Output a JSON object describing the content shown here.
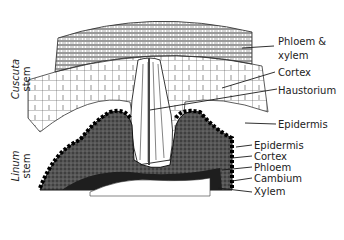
{
  "figure": {
    "side_labels": {
      "cuscuta": {
        "name": "Cuscuta",
        "suffix": "stem"
      },
      "linum": {
        "name": "Linum",
        "suffix": "stem"
      }
    },
    "labels": {
      "phloem_xylem_1": "Phloem &",
      "phloem_xylem_2": "xylem",
      "cortex_top": "Cortex",
      "haustorium": "Haustorium",
      "epidermis_top": "Epidermis",
      "epidermis_bottom": "Epidermis",
      "cortex_bottom": "Cortex",
      "phloem": "Phloem",
      "cambium": "Cambium",
      "xylem": "Xylem"
    },
    "colors": {
      "line": "#1a1a1a",
      "tissue_dark": "#1e1e1e",
      "background": "#ffffff"
    }
  }
}
